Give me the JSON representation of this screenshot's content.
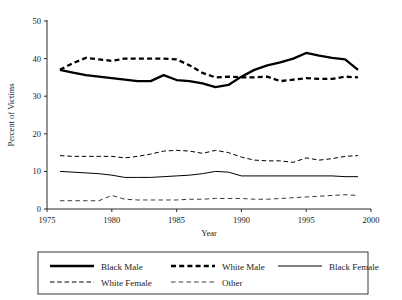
{
  "chart_data": {
    "type": "line",
    "title": "",
    "xlabel": "Year",
    "ylabel": "Percent of Victims",
    "xlim": [
      1975,
      2000
    ],
    "ylim": [
      0,
      50
    ],
    "xticks": [
      1975,
      1980,
      1985,
      1990,
      1995,
      2000
    ],
    "yticks": [
      0,
      10,
      20,
      30,
      40,
      50
    ],
    "grid": false,
    "legend_position": "bottom",
    "x": [
      1976,
      1977,
      1978,
      1979,
      1980,
      1981,
      1982,
      1983,
      1984,
      1985,
      1986,
      1987,
      1988,
      1989,
      1990,
      1991,
      1992,
      1993,
      1994,
      1995,
      1996,
      1997,
      1998,
      1999
    ],
    "series": [
      {
        "name": "Black Male",
        "style": "thick-solid",
        "color": "#000000",
        "values": [
          37.0,
          36.3,
          35.6,
          35.2,
          34.8,
          34.4,
          34.0,
          34.0,
          35.6,
          34.3,
          34.0,
          33.4,
          32.4,
          33.0,
          35.2,
          37.0,
          38.2,
          39.0,
          40.0,
          41.5,
          40.8,
          40.2,
          39.8,
          37.0
        ]
      },
      {
        "name": "White Male",
        "style": "thick-dashed",
        "color": "#000000",
        "values": [
          37.0,
          38.8,
          40.2,
          39.8,
          39.4,
          40.0,
          40.0,
          40.0,
          40.0,
          39.8,
          38.2,
          36.2,
          35.0,
          35.2,
          35.0,
          35.0,
          35.2,
          34.0,
          34.4,
          34.8,
          34.6,
          34.6,
          35.2,
          35.0
        ]
      },
      {
        "name": "Black Female",
        "style": "thin-solid",
        "color": "#000000",
        "values": [
          10.0,
          9.8,
          9.6,
          9.4,
          9.0,
          8.4,
          8.4,
          8.4,
          8.6,
          8.8,
          9.0,
          9.4,
          10.0,
          9.8,
          8.8,
          8.8,
          8.8,
          8.8,
          8.8,
          8.8,
          8.8,
          8.8,
          8.6,
          8.6
        ]
      },
      {
        "name": "White Female",
        "style": "thin-dashed",
        "color": "#000000",
        "values": [
          14.2,
          14.0,
          14.0,
          14.0,
          14.0,
          13.6,
          14.0,
          14.6,
          15.4,
          15.6,
          15.4,
          14.8,
          15.6,
          15.0,
          13.8,
          13.0,
          12.8,
          12.8,
          12.4,
          13.6,
          13.0,
          13.4,
          14.0,
          14.2
        ]
      },
      {
        "name": "Other",
        "style": "thin-dashed-light",
        "color": "#3a3a3a",
        "values": [
          2.2,
          2.2,
          2.2,
          2.2,
          3.6,
          2.6,
          2.4,
          2.4,
          2.4,
          2.4,
          2.6,
          2.6,
          2.8,
          2.8,
          2.8,
          2.6,
          2.6,
          2.8,
          3.0,
          3.2,
          3.4,
          3.6,
          3.8,
          3.6
        ]
      }
    ],
    "legend": [
      {
        "label": "Black Male",
        "style": "thick-solid"
      },
      {
        "label": "White Male",
        "style": "thick-dashed"
      },
      {
        "label": "Black Female",
        "style": "thin-solid"
      },
      {
        "label": "White Female",
        "style": "thin-dashed"
      },
      {
        "label": "Other",
        "style": "thin-dashed-light"
      }
    ]
  }
}
